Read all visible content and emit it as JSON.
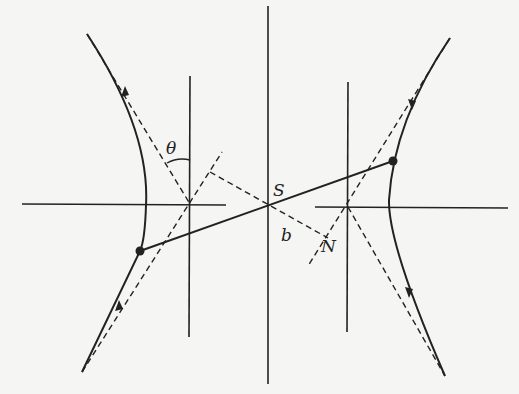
{
  "diagram": {
    "title": "",
    "labels": {
      "theta": "θ",
      "S": "S",
      "b": "b",
      "N": "N"
    },
    "colors": {
      "ink": "#222222",
      "background": "#f5f5f3"
    },
    "elements": [
      "left hyperbola branch with arrow",
      "right hyperbola branch with arrow",
      "asymptotes (dashed)",
      "horizontal axis lines",
      "vertical directrix lines",
      "central vertical axis through S",
      "solid line joining two points on branches through S",
      "dashed perpendicular from S to asymptote meeting at N",
      "angle theta between asymptote and vertical"
    ]
  }
}
